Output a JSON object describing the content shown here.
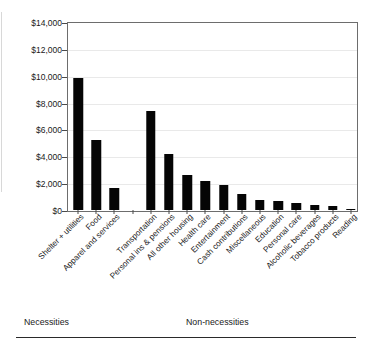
{
  "chart_data": {
    "type": "bar",
    "title": "",
    "subtitle": "",
    "xlabel": "",
    "ylabel": "",
    "ylim": [
      0,
      14000
    ],
    "ytick_values": [
      0,
      2000,
      4000,
      6000,
      8000,
      10000,
      12000,
      14000
    ],
    "ytick_labels": [
      "$0",
      "$2,000",
      "$4,000",
      "$6,000",
      "$8,000",
      "$10,000",
      "$12,000",
      "$14,000"
    ],
    "grid": true,
    "legend": "none",
    "bar_color": "#050505",
    "gridline_color": "#e9e9e9",
    "axis_color": "#6d6d6d",
    "categories": [
      "Shelter + utilities",
      "Food",
      "Apparel and services",
      "",
      "Transportation",
      "Personal ins & pensions",
      "All other housing",
      "Health care",
      "Entertainment",
      "Cash contributions",
      "Miscellaneous",
      "Education",
      "Personal care",
      "Alcoholic beverages",
      "Tobacco products",
      "Reading"
    ],
    "values": [
      9800,
      5180,
      1630,
      null,
      7380,
      4140,
      2580,
      2140,
      1860,
      1180,
      740,
      700,
      500,
      380,
      320,
      110
    ],
    "groups": [
      {
        "label": "Necessities",
        "categories": [
          "Shelter + utilities",
          "Food",
          "Apparel and services"
        ]
      },
      {
        "label": "Non-necessities",
        "categories": [
          "Transportation",
          "Personal ins & pensions",
          "All other housing",
          "Health care",
          "Entertainment",
          "Cash contributions",
          "Miscellaneous",
          "Education",
          "Personal care",
          "Alcoholic beverages",
          "Tobacco products",
          "Reading"
        ]
      }
    ]
  },
  "groups": {
    "necessities": "Necessities",
    "non_necessities": "Non-necessities"
  }
}
